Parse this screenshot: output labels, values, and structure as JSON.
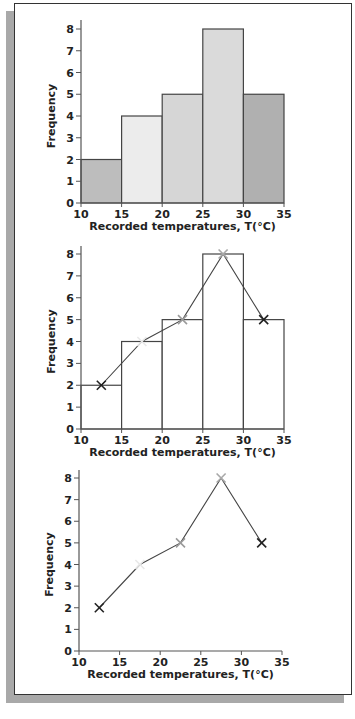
{
  "chart_data": [
    {
      "type": "bar",
      "subtype": "histogram",
      "title": "",
      "xlabel": "Recorded temperatures, T(°C)",
      "ylabel": "Frequency",
      "bin_edges": [
        10,
        15,
        20,
        25,
        30,
        35
      ],
      "categories": [
        "10-15",
        "15-20",
        "20-25",
        "25-30",
        "30-35"
      ],
      "values": [
        2,
        4,
        5,
        8,
        5
      ],
      "bar_colors": [
        "#bdbdbd",
        "#ececec",
        "#d6d6d6",
        "#dadada",
        "#b0b0b0"
      ],
      "xticks": [
        10,
        15,
        20,
        25,
        30,
        35
      ],
      "yticks": [
        0,
        1,
        2,
        3,
        4,
        5,
        6,
        7,
        8
      ],
      "xlim": [
        10,
        35
      ],
      "ylim": [
        0,
        8
      ],
      "grid": false,
      "legend": null
    },
    {
      "type": "bar",
      "subtype": "histogram-with-frequency-polygon",
      "title": "",
      "xlabel": "Recorded temperatures, T(°C)",
      "ylabel": "Frequency",
      "bin_edges": [
        10,
        15,
        20,
        25,
        30,
        35
      ],
      "categories": [
        "10-15",
        "15-20",
        "20-25",
        "25-30",
        "30-35"
      ],
      "values": [
        2,
        4,
        5,
        8,
        5
      ],
      "bar_colors": [
        "#ffffff",
        "#ffffff",
        "#ffffff",
        "#ffffff",
        "#ffffff"
      ],
      "polygon": {
        "x": [
          12.5,
          17.5,
          22.5,
          27.5,
          32.5
        ],
        "y": [
          2,
          4,
          5,
          8,
          5
        ],
        "marker": "x",
        "marker_colors": [
          "#222222",
          "#e8e8e8",
          "#9a9a9a",
          "#a8a8a8",
          "#222222"
        ]
      },
      "xticks": [
        10,
        15,
        20,
        25,
        30,
        35
      ],
      "yticks": [
        0,
        1,
        2,
        3,
        4,
        5,
        6,
        7,
        8
      ],
      "xlim": [
        10,
        35
      ],
      "ylim": [
        0,
        8
      ],
      "grid": false,
      "legend": null
    },
    {
      "type": "line",
      "subtype": "frequency-polygon",
      "title": "",
      "xlabel": "Recorded temperatures, T(°C)",
      "ylabel": "Frequency",
      "x": [
        12.5,
        17.5,
        22.5,
        27.5,
        32.5
      ],
      "y": [
        2,
        4,
        5,
        8,
        5
      ],
      "marker": "x",
      "marker_colors": [
        "#222222",
        "#e8e8e8",
        "#9a9a9a",
        "#a8a8a8",
        "#222222"
      ],
      "xticks": [
        10,
        15,
        20,
        25,
        30,
        35
      ],
      "yticks": [
        0,
        1,
        2,
        3,
        4,
        5,
        6,
        7,
        8
      ],
      "xlim": [
        10,
        35
      ],
      "ylim": [
        0,
        8
      ],
      "grid": false,
      "legend": null
    }
  ],
  "layout": {
    "panels": [
      {
        "x0": 81,
        "x1": 284,
        "y0": 203,
        "y8": 29,
        "axis_top": 20
      },
      {
        "x0": 81,
        "x1": 284,
        "y0": 429,
        "y8": 254,
        "axis_top": 246
      },
      {
        "x0": 79,
        "x1": 282,
        "y0": 651,
        "y8": 478,
        "axis_top": 470
      }
    ],
    "colors": {
      "axis": "#555555",
      "bar_edge": "#444444",
      "line": "#444444",
      "text": "#222222"
    }
  }
}
